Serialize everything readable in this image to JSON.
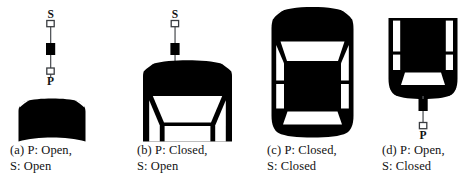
{
  "figure": {
    "background_color": "#ffffff",
    "ink_color": "#000000",
    "text_color": "#111111",
    "legend_labels": {
      "sensor_top": "S",
      "sensor_bottom": "P"
    },
    "panels": [
      {
        "id": "a",
        "tag": "(a)",
        "caption_line1": "(a)  P:  Open,",
        "caption_line2": "S: Open",
        "p_state": "Open",
        "s_state": "Open",
        "antenna_visible": true,
        "antenna_top_label": "S",
        "antenna_bottom_label": "P",
        "car_view": "rear-sliver",
        "windows_visible": false
      },
      {
        "id": "b",
        "tag": "(b)",
        "caption_line1": "(b) P: Closed,",
        "caption_line2": "S: Open",
        "p_state": "Closed",
        "s_state": "Open",
        "antenna_visible": true,
        "antenna_top_label": "S",
        "antenna_bottom_label": "",
        "car_view": "front-half",
        "windows_visible": true
      },
      {
        "id": "c",
        "tag": "(c)",
        "caption_line1": "(c) P: Closed,",
        "caption_line2": "S: Closed",
        "p_state": "Closed",
        "s_state": "Closed",
        "antenna_visible": false,
        "antenna_top_label": "",
        "antenna_bottom_label": "",
        "car_view": "full-top",
        "windows_visible": true
      },
      {
        "id": "d",
        "tag": "(d)",
        "caption_line1": "(d)  P:  Open,",
        "caption_line2": "S: Closed",
        "p_state": "Open",
        "s_state": "Closed",
        "antenna_visible": true,
        "antenna_top_label": "",
        "antenna_bottom_label": "P",
        "car_view": "rear-half",
        "windows_visible": true
      }
    ]
  }
}
